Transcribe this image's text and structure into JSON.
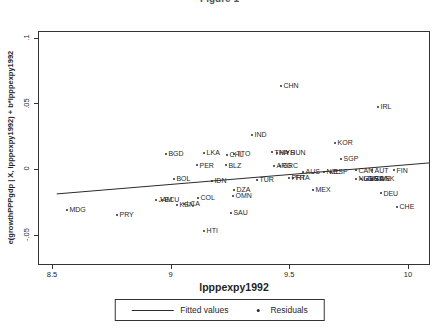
{
  "figure": {
    "partial_title": "Figure 1"
  },
  "chart_data": {
    "type": "scatter",
    "title": "Figure 1",
    "xlabel": "lpppexpy1992",
    "ylabel": "e(growthPPPgdp | X, lpppexpy1992) + b*lpppexpy1992",
    "xlim": [
      8.441,
      10.093
    ],
    "ylim": [
      -0.0731,
      0.105
    ],
    "x_ticks": [
      8.5,
      9,
      9.5,
      10
    ],
    "x_tick_labels": [
      "8.5",
      "9",
      "9.5",
      "10"
    ],
    "y_ticks": [
      -0.05,
      0,
      0.05,
      0.1
    ],
    "y_tick_labels": [
      "-.05",
      "0",
      ".05",
      ".1"
    ],
    "grid": false,
    "legend_position": "bottom-center",
    "legend": {
      "fitted": "Fitted values",
      "residuals": "Residuals"
    },
    "fitted_line": {
      "x": [
        8.52,
        10.09
      ],
      "y": [
        -0.019,
        0.0046
      ]
    },
    "points": [
      {
        "label": "CHN",
        "x": 9.465,
        "y": 0.0632
      },
      {
        "label": "IRL",
        "x": 9.874,
        "y": 0.0472
      },
      {
        "label": "IND",
        "x": 9.343,
        "y": 0.0259
      },
      {
        "label": "KOR",
        "x": 9.693,
        "y": 0.0198
      },
      {
        "label": "SGP",
        "x": 9.718,
        "y": 0.0076
      },
      {
        "label": "BGD",
        "x": 8.98,
        "y": 0.0114
      },
      {
        "label": "LKA",
        "x": 9.141,
        "y": 0.0122
      },
      {
        "label": "CHL",
        "x": 9.238,
        "y": 0.0107
      },
      {
        "label": "TTO",
        "x": 9.267,
        "y": 0.0114
      },
      {
        "label": "PER",
        "x": 9.111,
        "y": 0.003
      },
      {
        "label": "BLZ",
        "x": 9.233,
        "y": 0.003
      },
      {
        "label": "BOL",
        "x": 9.014,
        "y": -0.0076
      },
      {
        "label": "IDN",
        "x": 9.174,
        "y": -0.0091
      },
      {
        "label": "TUR",
        "x": 9.364,
        "y": -0.0084
      },
      {
        "label": "THA",
        "x": 9.427,
        "y": 0.0129
      },
      {
        "label": "MYS",
        "x": 9.448,
        "y": 0.0122
      },
      {
        "label": "HUN",
        "x": 9.494,
        "y": 0.0129
      },
      {
        "label": "ARG",
        "x": 9.436,
        "y": 0.0023
      },
      {
        "label": "GRC",
        "x": 9.461,
        "y": 0.0023
      },
      {
        "label": "PRT",
        "x": 9.499,
        "y": -0.0068
      },
      {
        "label": "FRA",
        "x": 9.516,
        "y": -0.0068
      },
      {
        "label": "AUS",
        "x": 9.558,
        "y": -0.0023
      },
      {
        "label": "NZL",
        "x": 9.646,
        "y": -0.0023
      },
      {
        "label": "ESP",
        "x": 9.676,
        "y": -0.0023
      },
      {
        "label": "CAN",
        "x": 9.781,
        "y": -0.0008
      },
      {
        "label": "AUT",
        "x": 9.849,
        "y": -0.0008
      },
      {
        "label": "FIN",
        "x": 9.941,
        "y": -0.0008
      },
      {
        "label": "NLD",
        "x": 9.781,
        "y": -0.0076
      },
      {
        "label": "GBR",
        "x": 9.802,
        "y": -0.0076
      },
      {
        "label": "USA",
        "x": 9.827,
        "y": -0.0076
      },
      {
        "label": "SWE",
        "x": 9.848,
        "y": -0.0076
      },
      {
        "label": "DNK",
        "x": 9.87,
        "y": -0.0076
      },
      {
        "label": "MEX",
        "x": 9.6,
        "y": -0.016
      },
      {
        "label": "DEU",
        "x": 9.886,
        "y": -0.0183
      },
      {
        "label": "CHE",
        "x": 9.954,
        "y": -0.0289
      },
      {
        "label": "DZA",
        "x": 9.267,
        "y": -0.016
      },
      {
        "label": "OMN",
        "x": 9.263,
        "y": -0.0205
      },
      {
        "label": "SAU",
        "x": 9.254,
        "y": -0.0335
      },
      {
        "label": "HTI",
        "x": 9.141,
        "y": -0.0472
      },
      {
        "label": "COL",
        "x": 9.115,
        "y": -0.0221
      },
      {
        "label": "KEN",
        "x": 9.027,
        "y": -0.0274
      },
      {
        "label": "LCA",
        "x": 9.056,
        "y": -0.0266
      },
      {
        "label": "JAM",
        "x": 8.938,
        "y": -0.0236
      },
      {
        "label": "ECU",
        "x": 8.964,
        "y": -0.0236
      },
      {
        "label": "MDG",
        "x": 8.563,
        "y": -0.0312
      },
      {
        "label": "PRY",
        "x": 8.774,
        "y": -0.035
      }
    ]
  }
}
